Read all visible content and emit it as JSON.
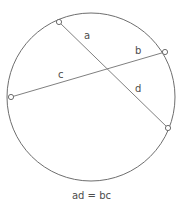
{
  "figure": {
    "caption": "ad = bc",
    "caption_position": {
      "y": 190
    },
    "colors": {
      "stroke": "#808080",
      "circle_stroke": "#6e6e6e",
      "text": "#4d4d4d",
      "background": "#ffffff",
      "marker_fill": "#ffffff",
      "marker_stroke": "#6e6e6e"
    },
    "circle": {
      "cx": 91,
      "cy": 97,
      "r": 84,
      "stroke_width": 1
    },
    "points": [
      {
        "id": "P1",
        "name": "top-left-point",
        "x": 59,
        "y": 22,
        "r": 2.6
      },
      {
        "id": "P2",
        "name": "right-point",
        "x": 165,
        "y": 52,
        "r": 2.6
      },
      {
        "id": "P3",
        "name": "left-point",
        "x": 11,
        "y": 97,
        "r": 2.6
      },
      {
        "id": "P4",
        "name": "bottom-right-point",
        "x": 168,
        "y": 128,
        "r": 2.6
      }
    ],
    "intersection": {
      "name": "chord-intersection",
      "x": 107,
      "y": 72
    },
    "chords": [
      {
        "id": "chord-1",
        "name": "chord-a-d",
        "from": "P1",
        "to": "P4",
        "x1": 59,
        "y1": 22,
        "x2": 168,
        "y2": 128,
        "stroke_width": 1,
        "segments": [
          "a",
          "d"
        ]
      },
      {
        "id": "chord-2",
        "name": "chord-c-b",
        "from": "P3",
        "to": "P2",
        "x1": 11,
        "y1": 97,
        "x2": 165,
        "y2": 52,
        "stroke_width": 1,
        "segments": [
          "c",
          "b"
        ]
      }
    ],
    "labels": [
      {
        "id": "a",
        "text": "a",
        "x": 84,
        "y": 31,
        "chord": "chord-1",
        "segment": "upper"
      },
      {
        "id": "b",
        "text": "b",
        "x": 135,
        "y": 46,
        "chord": "chord-2",
        "segment": "right"
      },
      {
        "id": "c",
        "text": "c",
        "x": 58,
        "y": 70,
        "chord": "chord-2",
        "segment": "left"
      },
      {
        "id": "d",
        "text": "d",
        "x": 135,
        "y": 84,
        "chord": "chord-1",
        "segment": "lower"
      }
    ]
  }
}
